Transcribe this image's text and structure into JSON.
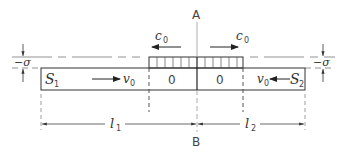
{
  "diagram": {
    "labels": {
      "top_point": "A",
      "bottom_point": "B",
      "left_body": "S",
      "left_body_sub": "1",
      "right_body": "S",
      "right_body_sub": "2",
      "velocity": "v",
      "velocity_sub": "0",
      "wave_speed": "c",
      "wave_speed_sub": "0",
      "zone_value_left": "0",
      "zone_value_right": "0",
      "stress_left": "−σ",
      "stress_right": "−σ",
      "length_left": "l",
      "length_left_sub": "1",
      "length_right": "l",
      "length_right_sub": "2"
    },
    "colors": {
      "line": "#333333",
      "light_line": "#777777"
    }
  }
}
